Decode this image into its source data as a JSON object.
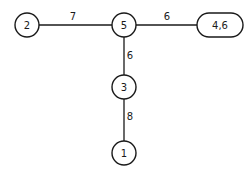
{
  "diagram": {
    "type": "tree",
    "nodes": [
      {
        "id": "n2",
        "label": "2",
        "shape": "circle",
        "cx": 27,
        "cy": 25,
        "r": 12
      },
      {
        "id": "n5",
        "label": "5",
        "shape": "circle",
        "cx": 124,
        "cy": 25,
        "r": 12
      },
      {
        "id": "n46",
        "label": "4,6",
        "shape": "pill",
        "cx": 220,
        "cy": 25,
        "w": 46,
        "h": 24
      },
      {
        "id": "n3",
        "label": "3",
        "shape": "circle",
        "cx": 124,
        "cy": 87,
        "r": 12
      },
      {
        "id": "n1",
        "label": "1",
        "shape": "circle",
        "cx": 124,
        "cy": 153,
        "r": 12
      }
    ],
    "edges": [
      {
        "from": "2",
        "to": "5",
        "weight": "7"
      },
      {
        "from": "5",
        "to": "4,6",
        "weight": "6"
      },
      {
        "from": "5",
        "to": "3",
        "weight": "6"
      },
      {
        "from": "3",
        "to": "1",
        "weight": "8"
      }
    ]
  }
}
